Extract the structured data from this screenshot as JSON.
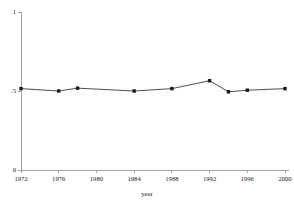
{
  "chart_data": {
    "type": "line",
    "title": "",
    "subtitle": "",
    "xlabel": "year",
    "ylabel": "",
    "xlim": [
      1971,
      2001
    ],
    "ylim": [
      0,
      1
    ],
    "grid": false,
    "legend": null,
    "x_ticks": [
      1972,
      1976,
      1980,
      1984,
      1988,
      1992,
      1996,
      2000
    ],
    "x_tick_labels": [
      "1972",
      "1976",
      "1980",
      "1984",
      "1988",
      "1992",
      "1996",
      "2000"
    ],
    "y_ticks": [
      0,
      0.5,
      1
    ],
    "y_tick_labels": [
      "0",
      ".5",
      "1"
    ],
    "markers": "filled-square",
    "line_color": "#3b3b3b",
    "marker_color": "#1a1a1a",
    "axis_color": "#8c8c8c",
    "background_color": "#ffffff",
    "series": [
      {
        "name": "series-1",
        "x": [
          1972,
          1976,
          1978,
          1984,
          1988,
          1992,
          1994,
          1996,
          2000
        ],
        "values": [
          0.515,
          0.5,
          0.518,
          0.5,
          0.515,
          0.565,
          0.495,
          0.505,
          0.515
        ]
      }
    ]
  }
}
